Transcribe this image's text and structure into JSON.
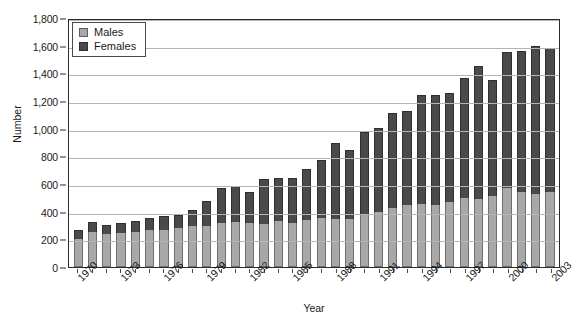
{
  "chart_data": {
    "type": "bar",
    "stacked": true,
    "title": "",
    "xlabel": "Year",
    "ylabel": "Number",
    "ylim": [
      0,
      1800
    ],
    "ytick_step": 200,
    "ytick_labels": [
      "0",
      "200",
      "400",
      "600",
      "800",
      "1,000",
      "1,200",
      "1,400",
      "1,600",
      "1,800"
    ],
    "grid": true,
    "legend_position": "top-left-inside",
    "xtick_label_rotation": -45,
    "xtick_label_interval": 3,
    "categories": [
      "1970",
      "1971",
      "1972",
      "1973",
      "1974",
      "1975",
      "1976",
      "1977",
      "1978",
      "1979",
      "1980",
      "1981",
      "1982",
      "1983",
      "1984",
      "1985",
      "1986",
      "1987",
      "1988",
      "1989",
      "1990",
      "1991",
      "1992",
      "1993",
      "1994",
      "1995",
      "1996",
      "1997",
      "1998",
      "1999",
      "2000",
      "2001",
      "2002",
      "2003"
    ],
    "series": [
      {
        "name": "Males",
        "color": "#a8a8a8",
        "values": [
          205,
          255,
          240,
          245,
          250,
          265,
          270,
          280,
          300,
          300,
          315,
          325,
          315,
          310,
          330,
          320,
          340,
          355,
          350,
          350,
          385,
          400,
          430,
          450,
          455,
          450,
          470,
          500,
          495,
          510,
          570,
          545,
          525,
          545
        ]
      },
      {
        "name": "Females",
        "color": "#4a4a4a",
        "values": [
          65,
          70,
          65,
          75,
          85,
          90,
          100,
          95,
          115,
          175,
          255,
          260,
          225,
          325,
          310,
          325,
          365,
          420,
          545,
          495,
          590,
          605,
          680,
          675,
          790,
          790,
          785,
          870,
          955,
          845,
          985,
          1020,
          1075,
          1040
        ]
      }
    ],
    "totals": [
      270,
      325,
      305,
      320,
      335,
      355,
      370,
      375,
      415,
      475,
      570,
      585,
      540,
      635,
      640,
      645,
      705,
      775,
      895,
      845,
      975,
      1005,
      1110,
      1125,
      1245,
      1240,
      1255,
      1370,
      1450,
      1355,
      1555,
      1565,
      1600,
      1585
    ]
  },
  "legend": {
    "items": [
      {
        "label": "Males"
      },
      {
        "label": "Females"
      }
    ]
  },
  "axes": {
    "y_title": "Number",
    "x_title": "Year"
  }
}
